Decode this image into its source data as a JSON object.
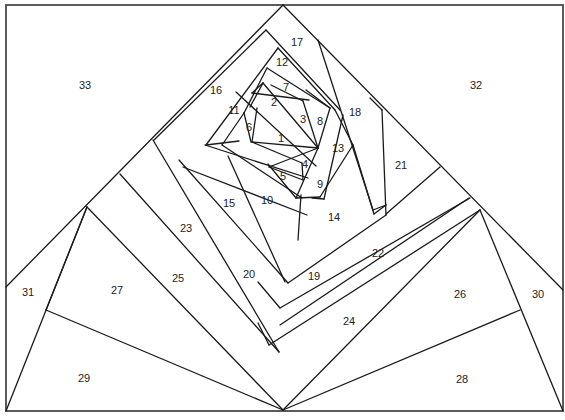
{
  "diagram": {
    "type": "foundation-paper-piecing-pattern",
    "colors": {
      "line": "#1a1a1a",
      "frame": "#4a4a4a",
      "background": "#ffffff",
      "label": "#222222"
    },
    "frame": {
      "x1": 6,
      "y1": 5,
      "x2": 563,
      "y2": 411
    },
    "segments": [
      [
        283,
        5,
        6,
        287
      ],
      [
        283,
        5,
        563,
        290
      ],
      [
        252,
        93,
        309,
        100
      ],
      [
        250,
        107,
        263,
        83
      ],
      [
        263,
        83,
        318,
        148
      ],
      [
        271,
        85,
        303,
        101
      ],
      [
        303,
        101,
        318,
        148
      ],
      [
        263,
        83,
        252,
        93
      ],
      [
        257,
        108,
        252,
        142
      ],
      [
        252,
        142,
        318,
        148
      ],
      [
        252,
        142,
        302,
        163
      ],
      [
        269,
        167,
        318,
        148
      ],
      [
        269,
        167,
        303,
        180
      ],
      [
        302,
        163,
        303,
        180
      ],
      [
        318,
        148,
        296,
        198
      ],
      [
        296,
        198,
        268,
        164
      ],
      [
        267,
        68,
        244,
        113
      ],
      [
        244,
        113,
        251,
        142
      ],
      [
        267,
        68,
        330,
        108
      ],
      [
        330,
        108,
        318,
        148
      ],
      [
        330,
        108,
        306,
        90
      ],
      [
        244,
        113,
        222,
        145
      ],
      [
        222,
        145,
        302,
        198
      ],
      [
        278,
        48,
        206,
        145
      ],
      [
        206,
        145,
        239,
        141
      ],
      [
        278,
        48,
        335,
        110
      ],
      [
        335,
        110,
        353,
        145
      ],
      [
        353,
        145,
        320,
        197
      ],
      [
        320,
        197,
        296,
        198
      ],
      [
        236,
        92,
        316,
        166
      ],
      [
        266,
        30,
        154,
        140
      ],
      [
        266,
        30,
        340,
        110
      ],
      [
        343,
        115,
        324,
        199
      ],
      [
        324,
        199,
        312,
        198
      ],
      [
        353,
        145,
        374,
        214
      ],
      [
        301,
        195,
        298,
        240
      ],
      [
        318,
        40,
        373,
        210
      ],
      [
        373,
        210,
        386,
        205
      ],
      [
        374,
        214,
        386,
        205
      ],
      [
        382,
        110,
        386,
        215
      ],
      [
        382,
        110,
        370,
        98
      ],
      [
        205,
        145,
        308,
        178
      ],
      [
        179,
        160,
        288,
        283
      ],
      [
        183,
        167,
        307,
        215
      ],
      [
        228,
        156,
        285,
        282
      ],
      [
        288,
        283,
        386,
        215
      ],
      [
        280,
        308,
        470,
        198
      ],
      [
        280,
        308,
        258,
        282
      ],
      [
        153,
        140,
        279,
        352
      ],
      [
        120,
        174,
        279,
        352
      ],
      [
        269,
        345,
        480,
        210
      ],
      [
        269,
        345,
        258,
        323
      ],
      [
        87,
        207,
        283,
        410
      ],
      [
        87,
        207,
        46,
        310
      ],
      [
        46,
        310,
        283,
        410
      ],
      [
        6,
        411,
        87,
        207
      ],
      [
        283,
        410,
        480,
        210
      ],
      [
        480,
        210,
        563,
        411
      ],
      [
        520,
        310,
        283,
        410
      ],
      [
        440,
        167,
        386,
        214
      ],
      [
        469,
        198,
        280,
        325
      ]
    ],
    "labels": [
      {
        "id": "1",
        "x": 281,
        "y": 139
      },
      {
        "id": "2",
        "x": 274,
        "y": 103
      },
      {
        "id": "3",
        "x": 303,
        "y": 120
      },
      {
        "id": "4",
        "x": 305,
        "y": 165
      },
      {
        "id": "5",
        "x": 283,
        "y": 177
      },
      {
        "id": "6",
        "x": 249,
        "y": 128
      },
      {
        "id": "7",
        "x": 286,
        "y": 88
      },
      {
        "id": "8",
        "x": 320,
        "y": 122
      },
      {
        "id": "9",
        "x": 320,
        "y": 185
      },
      {
        "id": "10",
        "x": 267,
        "y": 201
      },
      {
        "id": "11",
        "x": 234,
        "y": 111
      },
      {
        "id": "12",
        "x": 282,
        "y": 63
      },
      {
        "id": "13",
        "x": 338,
        "y": 149
      },
      {
        "id": "14",
        "x": 334,
        "y": 218
      },
      {
        "id": "15",
        "x": 229,
        "y": 204
      },
      {
        "id": "16",
        "x": 216,
        "y": 91
      },
      {
        "id": "17",
        "x": 297,
        "y": 43
      },
      {
        "id": "18",
        "x": 355,
        "y": 113
      },
      {
        "id": "19",
        "x": 314,
        "y": 277
      },
      {
        "id": "20",
        "x": 249,
        "y": 275
      },
      {
        "id": "21",
        "x": 401,
        "y": 166
      },
      {
        "id": "22",
        "x": 378,
        "y": 254
      },
      {
        "id": "23",
        "x": 186,
        "y": 229
      },
      {
        "id": "24",
        "x": 349,
        "y": 322
      },
      {
        "id": "25",
        "x": 178,
        "y": 279
      },
      {
        "id": "26",
        "x": 460,
        "y": 295
      },
      {
        "id": "27",
        "x": 117,
        "y": 291
      },
      {
        "id": "28",
        "x": 462,
        "y": 380
      },
      {
        "id": "29",
        "x": 84,
        "y": 379
      },
      {
        "id": "30",
        "x": 538,
        "y": 295
      },
      {
        "id": "31",
        "x": 28,
        "y": 293
      },
      {
        "id": "32",
        "x": 476,
        "y": 86
      },
      {
        "id": "33",
        "x": 85,
        "y": 86
      }
    ]
  }
}
